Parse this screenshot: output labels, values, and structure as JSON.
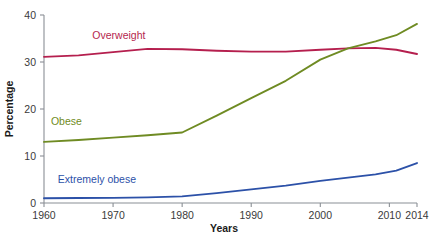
{
  "chart_data": {
    "type": "line",
    "title": "",
    "subtitle": "",
    "xlabel": "Years",
    "ylabel": "Percentage",
    "xlim": [
      1960,
      2014
    ],
    "ylim": [
      0,
      40
    ],
    "grid": false,
    "legend_position": "inline-labels",
    "x_ticks": [
      "1960",
      "1970",
      "1980",
      "1990",
      "2000",
      "2010",
      "2014"
    ],
    "x_tick_values": [
      1960,
      1970,
      1980,
      1990,
      2000,
      2010,
      2014
    ],
    "y_ticks": [
      "0",
      "10",
      "20",
      "30",
      "40"
    ],
    "y_tick_values": [
      0,
      10,
      20,
      30,
      40
    ],
    "series": [
      {
        "name": "Overweight",
        "color": "#b51f4e",
        "label_color": "#b51f4e",
        "x": [
          1960,
          1965,
          1970,
          1975,
          1980,
          1985,
          1990,
          1995,
          2000,
          2004,
          2008,
          2011,
          2014
        ],
        "values": [
          31.1,
          31.4,
          32.1,
          32.8,
          32.7,
          32.4,
          32.2,
          32.2,
          32.6,
          32.9,
          33.0,
          32.6,
          31.7
        ]
      },
      {
        "name": "Obese",
        "color": "#6f8b23",
        "label_color": "#6f8b23",
        "x": [
          1960,
          1965,
          1970,
          1975,
          1980,
          1985,
          1990,
          1995,
          2000,
          2004,
          2008,
          2011,
          2014
        ],
        "values": [
          13.0,
          13.4,
          13.9,
          14.4,
          15.0,
          18.6,
          22.3,
          26.0,
          30.5,
          32.9,
          34.4,
          35.7,
          38.1
        ]
      },
      {
        "name": "Extremely obese",
        "color": "#2c51a8",
        "label_color": "#2c51a8",
        "x": [
          1960,
          1965,
          1970,
          1975,
          1980,
          1985,
          1990,
          1995,
          2000,
          2004,
          2008,
          2011,
          2014
        ],
        "values": [
          1.0,
          1.05,
          1.1,
          1.2,
          1.4,
          2.1,
          2.9,
          3.7,
          4.7,
          5.4,
          6.1,
          6.9,
          8.5
        ]
      }
    ],
    "annotations": [
      {
        "text": "Overweight",
        "series": "Overweight",
        "x": 1967,
        "y": 34.8,
        "color": "#b51f4e"
      },
      {
        "text": "Obese",
        "series": "Obese",
        "x": 1961,
        "y": 16.6,
        "color": "#6f8b23"
      },
      {
        "text": "Extremely obese",
        "series": "Extremely obese",
        "x": 1962,
        "y": 4.2,
        "color": "#2c51a8"
      }
    ]
  },
  "axes": {
    "x_title": "Years",
    "y_title": "Percentage"
  }
}
